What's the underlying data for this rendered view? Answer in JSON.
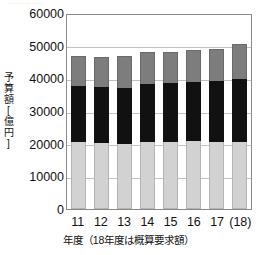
{
  "top_fragment": "............",
  "chart_data": {
    "type": "bar",
    "stacked": true,
    "title": "",
    "xlabel": "年度（18年度は概算要求額）",
    "ylabel": "予算額[億円]",
    "ylabel_chars": [
      "予",
      "算",
      "額",
      "[",
      "億",
      "円",
      "]"
    ],
    "categories": [
      "11",
      "12",
      "13",
      "14",
      "15",
      "16",
      "17",
      "(18)"
    ],
    "ylim": [
      0,
      60000
    ],
    "ytick_values": [
      60000,
      50000,
      40000,
      30000,
      20000,
      10000,
      0
    ],
    "ytick_labels": [
      "60000",
      "50000",
      "40000",
      "30000",
      "20000",
      "10000",
      "0"
    ],
    "grid": true,
    "legend": "none",
    "series": [
      {
        "name": "下段（淡灰）",
        "color": "#d2d2d2",
        "values": [
          20500,
          20200,
          19900,
          20500,
          20500,
          20800,
          20500,
          20500
        ]
      },
      {
        "name": "中段（黒）",
        "color": "#111111",
        "values": [
          17100,
          17100,
          17100,
          17700,
          18000,
          18000,
          18600,
          19300
        ]
      },
      {
        "name": "上段（濃灰）",
        "color": "#7d7d7d",
        "values": [
          9200,
          9200,
          9800,
          9800,
          9500,
          9800,
          9800,
          10700
        ]
      }
    ],
    "totals": [
      46800,
      46500,
      46800,
      48000,
      48000,
      48600,
      48900,
      50500
    ]
  }
}
